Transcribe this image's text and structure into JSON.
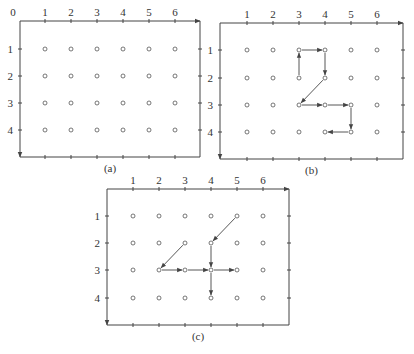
{
  "figure": {
    "panels": [
      {
        "id": "a",
        "caption": "(a)",
        "origin_label": "0",
        "box": {
          "left": 20,
          "top": 21,
          "right": 200,
          "bottom": 157
        },
        "col_x": [
          45,
          71,
          97,
          123,
          149,
          175
        ],
        "row_y": [
          49,
          76,
          103,
          130
        ],
        "col_labels": [
          "1",
          "2",
          "3",
          "4",
          "5",
          "6"
        ],
        "row_labels": [
          "1",
          "2",
          "3",
          "4"
        ],
        "arrows": []
      },
      {
        "id": "b",
        "caption": "(b)",
        "origin_label": "",
        "box": {
          "left": 220,
          "top": 23,
          "right": 403,
          "bottom": 159
        },
        "col_x": [
          247,
          273,
          299,
          325,
          351,
          377
        ],
        "row_y": [
          50,
          78,
          105,
          132
        ],
        "col_labels": [
          "1",
          "2",
          "3",
          "4",
          "5",
          "6"
        ],
        "row_labels": [
          "1",
          "2",
          "3",
          "4"
        ],
        "arrows": [
          {
            "from": [
              3,
              2
            ],
            "to": [
              3,
              1
            ]
          },
          {
            "from": [
              3,
              1
            ],
            "to": [
              4,
              1
            ]
          },
          {
            "from": [
              4,
              1
            ],
            "to": [
              4,
              2
            ]
          },
          {
            "from": [
              4,
              2
            ],
            "to": [
              3,
              3
            ]
          },
          {
            "from": [
              3,
              3
            ],
            "to": [
              4,
              3
            ]
          },
          {
            "from": [
              4,
              3
            ],
            "to": [
              5,
              3
            ]
          },
          {
            "from": [
              5,
              3
            ],
            "to": [
              5,
              4
            ]
          },
          {
            "from": [
              5,
              4
            ],
            "to": [
              4,
              4
            ]
          }
        ]
      },
      {
        "id": "c",
        "caption": "(c)",
        "origin_label": "",
        "box": {
          "left": 107,
          "top": 189,
          "right": 289,
          "bottom": 325
        },
        "col_x": [
          133,
          159,
          185,
          211,
          237,
          263
        ],
        "row_y": [
          216,
          243,
          270,
          298
        ],
        "col_labels": [
          "1",
          "2",
          "3",
          "4",
          "5",
          "6"
        ],
        "row_labels": [
          "1",
          "2",
          "3",
          "4"
        ],
        "arrows": [
          {
            "from": [
              5,
              1
            ],
            "to": [
              4,
              2
            ]
          },
          {
            "from": [
              4,
              2
            ],
            "to": [
              4,
              3
            ]
          },
          {
            "from": [
              3,
              2
            ],
            "to": [
              2,
              3
            ]
          },
          {
            "from": [
              2,
              3
            ],
            "to": [
              3,
              3
            ]
          },
          {
            "from": [
              3,
              3
            ],
            "to": [
              4,
              3
            ]
          },
          {
            "from": [
              4,
              3
            ],
            "to": [
              5,
              3
            ]
          },
          {
            "from": [
              4,
              3
            ],
            "to": [
              4,
              4
            ]
          }
        ]
      }
    ],
    "colors": {
      "line": "#444444",
      "dot": "#555555",
      "text": "#333333"
    }
  }
}
